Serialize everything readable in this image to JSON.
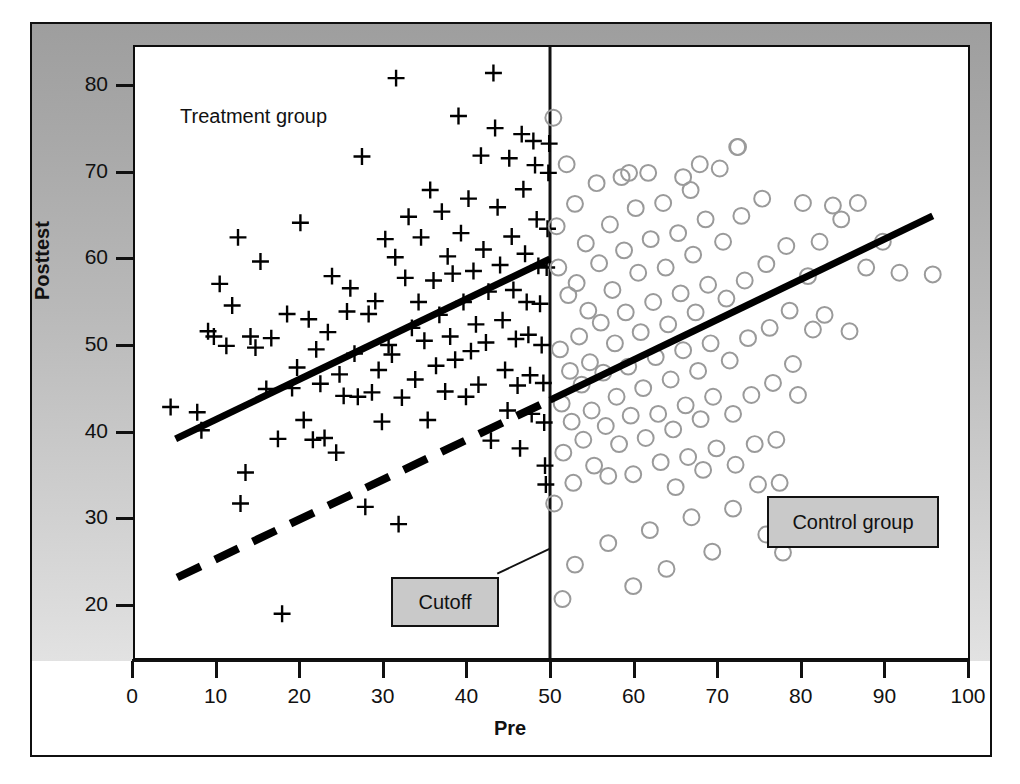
{
  "figure": {
    "background": "#ffffff",
    "band_color": "#b4b4b4",
    "plot_background": "#ffffff",
    "frame_color": "#101010"
  },
  "axes": {
    "x": {
      "label": "Pre",
      "ticks": [
        "0",
        "10",
        "20",
        "30",
        "40",
        "50",
        "60",
        "70",
        "80",
        "90",
        "100"
      ],
      "min": 0,
      "max": 100
    },
    "y": {
      "label": "Posttest",
      "ticks": [
        "80",
        "70",
        "60",
        "50",
        "40",
        "30",
        "20"
      ],
      "min": 14,
      "max": 85
    }
  },
  "annotations": {
    "treatment_label": "Treatment group",
    "control_label": "Control group",
    "cutoff_label": "Cutoff"
  },
  "chart_data": {
    "type": "scatter",
    "title": "",
    "xlabel": "Pre",
    "ylabel": "Posttest",
    "xlim": [
      0,
      100
    ],
    "ylim": [
      14,
      85
    ],
    "grid": false,
    "legend": "in-plot text labels",
    "cutoff": {
      "x": 50,
      "label": "Cutoff",
      "style": "vertical solid line"
    },
    "series": [
      {
        "name": "Treatment group",
        "marker": "plus",
        "color": "#000000",
        "x_range": [
          4,
          50
        ],
        "points": [
          [
            4.4,
            42.8
          ],
          [
            7.6,
            42.2
          ],
          [
            8.1,
            40.1
          ],
          [
            8.9,
            51.6
          ],
          [
            9.6,
            51.0
          ],
          [
            10.3,
            57.1
          ],
          [
            11.1,
            49.9
          ],
          [
            11.8,
            54.6
          ],
          [
            12.5,
            62.5
          ],
          [
            12.8,
            31.6
          ],
          [
            13.4,
            35.2
          ],
          [
            14.0,
            51.0
          ],
          [
            14.6,
            49.7
          ],
          [
            15.2,
            59.7
          ],
          [
            15.9,
            44.9
          ],
          [
            16.5,
            50.8
          ],
          [
            17.3,
            39.1
          ],
          [
            17.8,
            18.8
          ],
          [
            18.4,
            53.6
          ],
          [
            19.0,
            45.0
          ],
          [
            19.6,
            47.4
          ],
          [
            20.0,
            64.2
          ],
          [
            20.4,
            41.3
          ],
          [
            21.0,
            53.0
          ],
          [
            21.5,
            39.0
          ],
          [
            21.9,
            49.5
          ],
          [
            22.4,
            45.5
          ],
          [
            22.9,
            39.2
          ],
          [
            23.3,
            51.5
          ],
          [
            23.8,
            58.0
          ],
          [
            24.3,
            37.5
          ],
          [
            24.7,
            46.6
          ],
          [
            25.2,
            44.1
          ],
          [
            25.6,
            53.9
          ],
          [
            26.0,
            56.6
          ],
          [
            26.5,
            49.0
          ],
          [
            26.9,
            44.0
          ],
          [
            27.4,
            71.9
          ],
          [
            27.8,
            31.2
          ],
          [
            28.2,
            53.6
          ],
          [
            28.6,
            44.5
          ],
          [
            29.0,
            55.1
          ],
          [
            29.4,
            47.1
          ],
          [
            29.8,
            41.1
          ],
          [
            30.2,
            62.3
          ],
          [
            30.6,
            50.0
          ],
          [
            31.0,
            48.9
          ],
          [
            31.4,
            60.2
          ],
          [
            31.5,
            81.0
          ],
          [
            31.8,
            29.2
          ],
          [
            32.2,
            43.9
          ],
          [
            32.6,
            57.8
          ],
          [
            33.0,
            64.9
          ],
          [
            33.4,
            52.0
          ],
          [
            33.8,
            46.0
          ],
          [
            34.2,
            55.0
          ],
          [
            34.5,
            62.5
          ],
          [
            34.9,
            50.5
          ],
          [
            35.3,
            41.3
          ],
          [
            35.6,
            68.0
          ],
          [
            36.0,
            57.5
          ],
          [
            36.3,
            47.6
          ],
          [
            36.7,
            53.5
          ],
          [
            37.0,
            65.5
          ],
          [
            37.4,
            44.6
          ],
          [
            37.7,
            60.3
          ],
          [
            38.0,
            51.0
          ],
          [
            38.3,
            58.3
          ],
          [
            38.6,
            48.3
          ],
          [
            39.0,
            76.6
          ],
          [
            39.3,
            63.0
          ],
          [
            39.6,
            55.0
          ],
          [
            39.9,
            44.0
          ],
          [
            40.2,
            67.0
          ],
          [
            40.5,
            49.3
          ],
          [
            40.8,
            58.6
          ],
          [
            41.1,
            52.4
          ],
          [
            41.4,
            45.4
          ],
          [
            41.7,
            72.0
          ],
          [
            42.0,
            61.1
          ],
          [
            42.3,
            50.3
          ],
          [
            42.6,
            56.2
          ],
          [
            42.9,
            38.9
          ],
          [
            43.2,
            81.6
          ],
          [
            43.4,
            75.2
          ],
          [
            43.7,
            66.0
          ],
          [
            44.0,
            59.3
          ],
          [
            44.3,
            52.9
          ],
          [
            44.6,
            47.1
          ],
          [
            44.9,
            42.4
          ],
          [
            45.1,
            71.7
          ],
          [
            45.4,
            62.6
          ],
          [
            45.6,
            56.4
          ],
          [
            45.9,
            50.7
          ],
          [
            46.1,
            45.3
          ],
          [
            46.4,
            38.0
          ],
          [
            46.6,
            74.5
          ],
          [
            46.8,
            68.1
          ],
          [
            47.0,
            60.6
          ],
          [
            47.2,
            55.0
          ],
          [
            47.4,
            51.2
          ],
          [
            47.6,
            46.5
          ],
          [
            47.8,
            42.0
          ],
          [
            48.0,
            73.7
          ],
          [
            48.2,
            70.9
          ],
          [
            48.4,
            64.6
          ],
          [
            48.6,
            59.2
          ],
          [
            48.8,
            54.8
          ],
          [
            49.0,
            50.0
          ],
          [
            49.2,
            45.6
          ],
          [
            49.3,
            41.0
          ],
          [
            49.4,
            36.0
          ],
          [
            49.5,
            33.8
          ],
          [
            49.6,
            59.0
          ],
          [
            49.7,
            63.5
          ],
          [
            49.8,
            70.0
          ],
          [
            49.9,
            73.4
          ]
        ]
      },
      {
        "name": "Control group",
        "marker": "open-circle",
        "color": "#9a9a9a",
        "x_range": [
          50,
          97
        ],
        "points": [
          [
            50.4,
            76.4
          ],
          [
            50.5,
            31.6
          ],
          [
            50.8,
            63.8
          ],
          [
            51.0,
            59.0
          ],
          [
            51.2,
            49.5
          ],
          [
            51.4,
            43.2
          ],
          [
            51.6,
            37.5
          ],
          [
            52.0,
            71.0
          ],
          [
            52.2,
            55.8
          ],
          [
            52.4,
            47.0
          ],
          [
            52.6,
            41.1
          ],
          [
            52.8,
            34.0
          ],
          [
            53.0,
            66.4
          ],
          [
            53.2,
            57.2
          ],
          [
            53.5,
            51.0
          ],
          [
            53.8,
            45.4
          ],
          [
            54.0,
            39.0
          ],
          [
            54.3,
            61.8
          ],
          [
            54.6,
            54.0
          ],
          [
            54.8,
            48.0
          ],
          [
            55.0,
            42.4
          ],
          [
            55.3,
            36.0
          ],
          [
            55.6,
            68.8
          ],
          [
            55.9,
            59.5
          ],
          [
            56.1,
            52.6
          ],
          [
            56.4,
            46.8
          ],
          [
            56.7,
            40.6
          ],
          [
            57.0,
            34.8
          ],
          [
            57.2,
            64.0
          ],
          [
            57.5,
            56.4
          ],
          [
            57.8,
            50.2
          ],
          [
            58.0,
            44.0
          ],
          [
            58.3,
            38.5
          ],
          [
            58.6,
            69.5
          ],
          [
            58.9,
            61.0
          ],
          [
            59.1,
            53.8
          ],
          [
            59.4,
            47.5
          ],
          [
            59.7,
            41.8
          ],
          [
            60.0,
            35.0
          ],
          [
            60.3,
            65.9
          ],
          [
            60.6,
            58.4
          ],
          [
            60.9,
            51.5
          ],
          [
            61.2,
            45.0
          ],
          [
            61.5,
            39.2
          ],
          [
            61.8,
            70.0
          ],
          [
            62.1,
            62.3
          ],
          [
            62.4,
            55.0
          ],
          [
            62.7,
            48.6
          ],
          [
            63.0,
            42.0
          ],
          [
            63.3,
            36.4
          ],
          [
            63.6,
            66.5
          ],
          [
            63.9,
            59.0
          ],
          [
            64.2,
            52.4
          ],
          [
            64.5,
            46.0
          ],
          [
            64.8,
            40.2
          ],
          [
            65.1,
            33.5
          ],
          [
            65.4,
            63.0
          ],
          [
            65.7,
            56.0
          ],
          [
            66.0,
            49.4
          ],
          [
            66.3,
            43.0
          ],
          [
            66.6,
            37.0
          ],
          [
            66.9,
            68.0
          ],
          [
            67.2,
            60.5
          ],
          [
            67.5,
            53.8
          ],
          [
            67.8,
            47.0
          ],
          [
            68.1,
            41.4
          ],
          [
            68.4,
            35.5
          ],
          [
            68.7,
            64.6
          ],
          [
            69.0,
            57.0
          ],
          [
            69.3,
            50.2
          ],
          [
            69.6,
            44.0
          ],
          [
            70.0,
            38.0
          ],
          [
            70.4,
            70.5
          ],
          [
            70.8,
            62.0
          ],
          [
            71.2,
            55.4
          ],
          [
            71.6,
            48.2
          ],
          [
            72.0,
            42.0
          ],
          [
            72.3,
            36.1
          ],
          [
            72.6,
            73.0
          ],
          [
            73.0,
            65.0
          ],
          [
            73.4,
            57.5
          ],
          [
            73.8,
            50.8
          ],
          [
            74.2,
            44.2
          ],
          [
            74.6,
            38.5
          ],
          [
            75.0,
            33.8
          ],
          [
            75.5,
            67.0
          ],
          [
            76.0,
            59.4
          ],
          [
            76.4,
            52.0
          ],
          [
            76.8,
            45.6
          ],
          [
            77.2,
            39.0
          ],
          [
            77.6,
            34.0
          ],
          [
            78.0,
            25.9
          ],
          [
            78.4,
            61.5
          ],
          [
            78.8,
            54.0
          ],
          [
            79.2,
            47.8
          ],
          [
            79.8,
            44.2
          ],
          [
            80.4,
            66.5
          ],
          [
            81.0,
            58.0
          ],
          [
            81.6,
            51.8
          ],
          [
            82.4,
            62.0
          ],
          [
            83.0,
            53.5
          ],
          [
            84.0,
            66.2
          ],
          [
            85.0,
            64.6
          ],
          [
            86.0,
            51.6
          ],
          [
            87.0,
            66.5
          ],
          [
            88.0,
            59.0
          ],
          [
            90.0,
            62.0
          ],
          [
            92.0,
            58.4
          ],
          [
            96.0,
            58.2
          ],
          [
            51.5,
            20.5
          ],
          [
            53.0,
            24.5
          ],
          [
            57.0,
            27.0
          ],
          [
            60.0,
            22.0
          ],
          [
            62.0,
            28.5
          ],
          [
            64.0,
            24.0
          ],
          [
            67.0,
            30.0
          ],
          [
            69.5,
            26.0
          ],
          [
            72.0,
            31.0
          ],
          [
            76.0,
            28.0
          ],
          [
            72.5,
            73.0
          ],
          [
            68.0,
            71.0
          ],
          [
            66.0,
            69.5
          ],
          [
            59.5,
            70.0
          ]
        ]
      }
    ],
    "lines": [
      {
        "name": "treatment-regression",
        "style": "solid",
        "color": "#000000",
        "width": 7,
        "from": [
          5.0,
          39.1
        ],
        "to": [
          50.0,
          60.0
        ]
      },
      {
        "name": "treatment-counterfactual",
        "style": "dashed",
        "color": "#000000",
        "width": 8,
        "from": [
          5.2,
          23.0
        ],
        "to": [
          50.0,
          43.6
        ]
      },
      {
        "name": "control-regression",
        "style": "solid",
        "color": "#000000",
        "width": 7,
        "from": [
          50.0,
          43.6
        ],
        "to": [
          96.0,
          65.0
        ]
      }
    ]
  }
}
